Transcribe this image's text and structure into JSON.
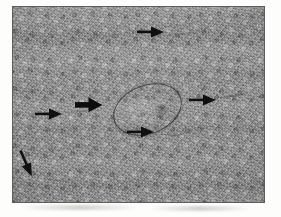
{
  "figure": {
    "type": "micrograph",
    "modality": "light-microscopy-grayscale-histology",
    "title": "",
    "caption": "",
    "plate": {
      "x": 12,
      "y": 6,
      "width": 253,
      "height": 197,
      "background_gray": "#8b8b8b",
      "border_color": "#5d5d5d",
      "mean_tone": "mid-gray granular tissue field"
    },
    "page_background": "#ffffff"
  },
  "annotations": {
    "arrow_color": "#111111",
    "count": 6,
    "arrows": [
      {
        "id": "arrow-top",
        "label": "top arrow",
        "direction": "right",
        "tip_x": 162,
        "tip_y": 31,
        "x": 136,
        "y": 24,
        "length": 26,
        "thickness": "thin",
        "points_at": "linear structure in upper field"
      },
      {
        "id": "arrow-thick-left-of-oval",
        "label": "thick arrow",
        "direction": "right",
        "tip_x": 100,
        "tip_y": 104,
        "x": 74,
        "y": 95,
        "length": 26,
        "thickness": "thick",
        "points_at": "margin of central oval structure"
      },
      {
        "id": "arrow-left-middle",
        "label": "left middle arrow",
        "direction": "right",
        "tip_x": 60,
        "tip_y": 113,
        "x": 34,
        "y": 106,
        "length": 26,
        "thickness": "thin",
        "points_at": "faint linear feature at left"
      },
      {
        "id": "arrow-right",
        "label": "right arrow",
        "direction": "right",
        "tip_x": 214,
        "tip_y": 99,
        "x": 188,
        "y": 92,
        "length": 26,
        "thickness": "thin",
        "points_at": "faint linear feature at right"
      },
      {
        "id": "arrow-below-oval",
        "label": "lower middle arrow",
        "direction": "right",
        "tip_x": 152,
        "tip_y": 131,
        "x": 126,
        "y": 124,
        "length": 26,
        "thickness": "thin",
        "points_at": "structure below central oval"
      },
      {
        "id": "arrow-bottom-left",
        "label": "bottom left arrow",
        "direction": "down-right",
        "tip_x": 35,
        "tip_y": 178,
        "x": 18,
        "y": 152,
        "length": 28,
        "thickness": "thin",
        "points_at": "faint feature in lower left field"
      }
    ]
  },
  "structures": {
    "central_oval": {
      "id": "oval-structure",
      "label": "central oval structure",
      "center_x": 133,
      "center_y": 101,
      "width": 69,
      "height": 47,
      "rotation_deg": -21,
      "outline_color": "#2a2a2a",
      "description": "sharply outlined ovoid body with granular interior and a small darker internal focus"
    }
  },
  "scale_bar": {
    "present": false,
    "text": ""
  },
  "labels": {
    "panel_letter": "",
    "magnification": ""
  }
}
